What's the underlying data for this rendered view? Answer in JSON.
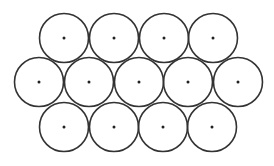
{
  "diagram": {
    "radius": 24.5,
    "stroke_color": "#333333",
    "dot_color": "#222222",
    "rows": [
      {
        "name": "top",
        "y": 38,
        "centers_x": [
          64,
          114,
          164,
          213
        ]
      },
      {
        "name": "middle",
        "y": 82,
        "centers_x": [
          39,
          89,
          139,
          188,
          238
        ]
      },
      {
        "name": "bottom",
        "y": 127,
        "centers_x": [
          64,
          114,
          163,
          212
        ]
      }
    ]
  }
}
